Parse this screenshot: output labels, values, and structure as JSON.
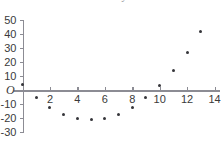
{
  "chart_data": {
    "type": "scatter",
    "title": "",
    "xlabel": "",
    "ylabel": "",
    "origin_label": "O",
    "xlim": [
      -0.6,
      14.4
    ],
    "ylim": [
      -30,
      50
    ],
    "grid": false,
    "legend": null,
    "x_ticks": [
      2,
      4,
      6,
      8,
      10,
      12,
      14
    ],
    "x_tick_labels": [
      "2",
      "4",
      "6",
      "8",
      "10",
      "12",
      "14"
    ],
    "y_ticks": [
      50,
      40,
      30,
      20,
      10,
      -10,
      -20,
      -30
    ],
    "y_tick_labels": [
      "50",
      "40",
      "30",
      "20",
      "10",
      "-10",
      "-20",
      "-30"
    ],
    "x": [
      0,
      1,
      2,
      3,
      4,
      5,
      6,
      7,
      8,
      9,
      10,
      11,
      12,
      13
    ],
    "values": [
      4,
      -5,
      -12.5,
      -17.5,
      -20,
      -21,
      -20,
      -17.5,
      -12.5,
      -5,
      3,
      14,
      27,
      42
    ],
    "marker_color": "#35353a",
    "axis_color": "#8c8c94"
  },
  "clipped_header": {
    "text": "x        n     y  -  -"
  }
}
